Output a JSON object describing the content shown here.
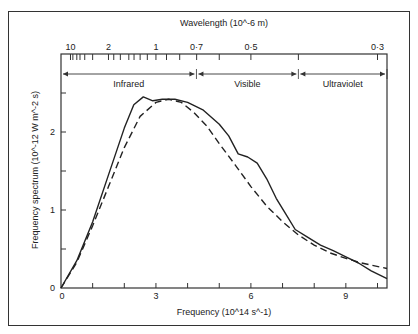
{
  "chart_data": {
    "type": "line",
    "title": "",
    "xlabel": "Frequency (10^14 s^-1)",
    "ylabel": "Frequency spectrum (10^-12 W m^-2 s)",
    "top_xlabel": "Wavelength (10^-6 m)",
    "xlim": [
      0,
      10.3
    ],
    "ylim": [
      0,
      3
    ],
    "x_ticks": [
      0,
      3,
      6,
      9
    ],
    "x_tick_labels": [
      "0",
      "3",
      "6",
      "9"
    ],
    "y_ticks": [
      0,
      1,
      2
    ],
    "y_tick_labels": [
      "0",
      "1",
      "2"
    ],
    "top_ticks": [
      {
        "label": "10",
        "freq": 0.3
      },
      {
        "label": "2",
        "freq": 1.5
      },
      {
        "label": "1",
        "freq": 3.0
      },
      {
        "label": "0·7",
        "freq": 4.28
      },
      {
        "label": "0·5",
        "freq": 6.0
      },
      {
        "label": "0·3",
        "freq": 10.0
      }
    ],
    "bands": [
      {
        "label": "Infrared",
        "from": 0,
        "to": 4.28
      },
      {
        "label": "Visible",
        "from": 4.28,
        "to": 7.5
      },
      {
        "label": "Ultraviolet",
        "from": 7.5,
        "to": 10.3
      }
    ],
    "grid": false,
    "series": [
      {
        "name": "Observed solar spectrum",
        "style": "solid",
        "x": [
          0,
          0.5,
          1.0,
          1.5,
          2.0,
          2.3,
          2.6,
          2.9,
          3.2,
          3.6,
          4.0,
          4.5,
          5.0,
          5.3,
          5.6,
          5.9,
          6.2,
          6.5,
          6.8,
          7.1,
          7.4,
          7.8,
          8.2,
          8.6,
          9.0,
          9.4,
          9.8,
          10.3
        ],
        "y": [
          0,
          0.35,
          0.85,
          1.45,
          2.05,
          2.35,
          2.45,
          2.4,
          2.42,
          2.42,
          2.38,
          2.28,
          2.1,
          1.95,
          1.72,
          1.68,
          1.6,
          1.4,
          1.15,
          0.95,
          0.75,
          0.65,
          0.55,
          0.48,
          0.4,
          0.32,
          0.22,
          0.12
        ]
      },
      {
        "name": "Blackbody curve",
        "style": "dashed",
        "x": [
          0,
          0.5,
          1.0,
          1.5,
          2.0,
          2.5,
          3.0,
          3.4,
          3.8,
          4.2,
          4.6,
          5.0,
          5.5,
          6.0,
          6.5,
          7.0,
          7.5,
          8.0,
          8.5,
          9.0,
          9.5,
          10.3
        ],
        "y": [
          0,
          0.33,
          0.8,
          1.3,
          1.8,
          2.2,
          2.38,
          2.42,
          2.38,
          2.25,
          2.08,
          1.85,
          1.58,
          1.3,
          1.05,
          0.85,
          0.68,
          0.55,
          0.45,
          0.38,
          0.32,
          0.25
        ]
      }
    ]
  }
}
